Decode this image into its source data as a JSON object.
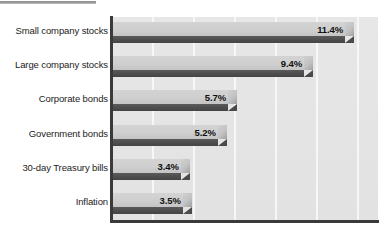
{
  "figure": {
    "background_color": "#ffffff",
    "width": 388,
    "height": 233
  },
  "decoration": {
    "top_rule_color": "#8d8d8d"
  },
  "plot": {
    "background_color": "#e4e4e4",
    "axis_color": "#3a3a3a",
    "gridline_color": "#f7f7f7",
    "bar_top_color": "#cfcfcf",
    "bar_body_color": "#4e4e4e"
  },
  "chart_data": {
    "type": "bar",
    "orientation": "horizontal",
    "title": "",
    "subtitle": "",
    "xlabel": "",
    "ylabel": "",
    "categories": [
      "Small company stocks",
      "Large company stocks",
      "Corporate bonds",
      "Government bonds",
      "30-day Treasury bills",
      "Inflation"
    ],
    "values": [
      11.4,
      9.4,
      5.7,
      5.2,
      3.4,
      3.5
    ],
    "data_labels": [
      "11.4%",
      "9.4%",
      "5.7%",
      "5.2%",
      "3.4%",
      "3.5%"
    ],
    "xlim": [
      0,
      13.0
    ],
    "ylim": null,
    "grid": true,
    "grid_axis": "x",
    "grid_ticks": [
      2,
      4,
      6,
      8,
      10,
      12
    ],
    "tick_labels": [],
    "legend": null,
    "legend_position": "none",
    "annotations": []
  }
}
